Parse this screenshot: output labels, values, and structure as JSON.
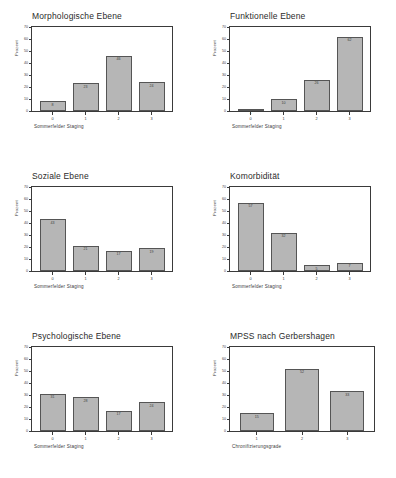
{
  "chart_data": [
    {
      "type": "bar",
      "title": "Morphologische Ebene",
      "xlabel": "Sommerfelder Staging",
      "ylabel": "Prozent",
      "categories": [
        "0",
        "1",
        "2",
        "3"
      ],
      "values": [
        8,
        23,
        46,
        24
      ],
      "ylim": [
        0,
        70
      ],
      "yticks": [
        "0",
        "10",
        "20",
        "30",
        "40",
        "50",
        "60",
        "70"
      ],
      "grid": false,
      "legend": "none"
    },
    {
      "type": "bar",
      "title": "Funktionelle Ebene",
      "xlabel": "Sommerfelder Staging",
      "ylabel": "Prozent",
      "categories": [
        "0",
        "1",
        "2",
        "3"
      ],
      "values": [
        1,
        10,
        26,
        62
      ],
      "ylim": [
        0,
        70
      ],
      "yticks": [
        "0",
        "10",
        "20",
        "30",
        "40",
        "50",
        "60",
        "70"
      ],
      "grid": false,
      "legend": "none"
    },
    {
      "type": "bar",
      "title": "Soziale Ebene",
      "xlabel": "Sommerfelder Staging",
      "ylabel": "Prozent",
      "categories": [
        "0",
        "1",
        "2",
        "3"
      ],
      "values": [
        43,
        21,
        17,
        19
      ],
      "ylim": [
        0,
        70
      ],
      "yticks": [
        "0",
        "10",
        "20",
        "30",
        "40",
        "50",
        "60",
        "70"
      ],
      "grid": false,
      "legend": "none"
    },
    {
      "type": "bar",
      "title": "Komorbidität",
      "xlabel": "Sommerfelder Staging",
      "ylabel": "Prozent",
      "categories": [
        "0",
        "1",
        "2",
        "3"
      ],
      "values": [
        57,
        32,
        5,
        7
      ],
      "ylim": [
        0,
        70
      ],
      "yticks": [
        "0",
        "10",
        "20",
        "30",
        "40",
        "50",
        "60",
        "70"
      ],
      "grid": false,
      "legend": "none"
    },
    {
      "type": "bar",
      "title": "Psychologische Ebene",
      "xlabel": "Sommerfelder Staging",
      "ylabel": "Prozent",
      "categories": [
        "0",
        "1",
        "2",
        "3"
      ],
      "values": [
        31,
        28,
        17,
        24
      ],
      "ylim": [
        0,
        70
      ],
      "yticks": [
        "0",
        "10",
        "20",
        "30",
        "40",
        "50",
        "60",
        "70"
      ],
      "grid": false,
      "legend": "none"
    },
    {
      "type": "bar",
      "title": "MPSS nach Gerbershagen",
      "xlabel": "Chronifizierungsgrade",
      "ylabel": "Prozent",
      "categories": [
        "1",
        "2",
        "3"
      ],
      "values": [
        15,
        52,
        33
      ],
      "ylim": [
        0,
        70
      ],
      "yticks": [
        "0",
        "10",
        "20",
        "30",
        "40",
        "50",
        "60",
        "70"
      ],
      "grid": false,
      "legend": "none"
    }
  ],
  "style": {
    "bar_fill": "#b6b6b6",
    "bar_stroke": "#555555",
    "axis_color": "#3a3a3a",
    "background": "#ffffff"
  }
}
